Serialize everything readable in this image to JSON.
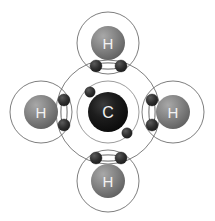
{
  "figure": {
    "background_color": "#ffffff",
    "width": 215,
    "height": 221
  },
  "molecule": {
    "formula": "CH4",
    "name": "Methane",
    "central_atom_symbol": "C",
    "outer_atom_symbol": "H",
    "outer_atom_count": 4,
    "bond_pair_count": 4,
    "electrons_per_bond_pair": 2,
    "carbon_inner_shell_electrons": 2,
    "carbon_outer_shell_electrons": 8
  },
  "colors": {
    "background": "#ffffff",
    "carbon_nucleus": "#141414",
    "carbon_nucleus_highlight": "#3a3a3a",
    "hydrogen_nucleus": "#7b7b7b",
    "hydrogen_nucleus_highlight": "#a6a6a6",
    "hydrogen_nucleus_shadow": "#5e5e5e",
    "electron": "#2e2e2e",
    "electron_highlight": "#565656",
    "shell_stroke": "#6f6f6f",
    "inner_shell_stroke": "#8a8a8a",
    "bond_lens_fill": "#ffffff",
    "bond_lens_stroke": "#555555",
    "atom_text": "#f2f2f2"
  },
  "atoms": [
    {
      "id": "carbon-center",
      "symbol": "C",
      "role": "central",
      "cx": 108,
      "cy": 112,
      "nucleus_r": 20,
      "inner_shell_r": 31,
      "outer_shell_r": 52
    },
    {
      "id": "hydrogen-top",
      "symbol": "H",
      "role": "outer",
      "position": "top",
      "cx": 108,
      "cy": 43,
      "nucleus_r": 17,
      "shell_r": 31
    },
    {
      "id": "hydrogen-bottom",
      "symbol": "H",
      "role": "outer",
      "position": "bottom",
      "cx": 108,
      "cy": 181,
      "nucleus_r": 17,
      "shell_r": 31
    },
    {
      "id": "hydrogen-left",
      "symbol": "H",
      "role": "outer",
      "position": "left",
      "cx": 41,
      "cy": 112,
      "nucleus_r": 17,
      "shell_r": 31
    },
    {
      "id": "hydrogen-right",
      "symbol": "H",
      "role": "outer",
      "position": "right",
      "cx": 173,
      "cy": 112,
      "nucleus_r": 17,
      "shell_r": 31
    }
  ],
  "carbon_inner_electrons": [
    {
      "id": "c-inner-e1",
      "cx": 90,
      "cy": 92,
      "r": 5.2
    },
    {
      "id": "c-inner-e2",
      "cx": 127,
      "cy": 133,
      "r": 5.2
    }
  ],
  "bond_pairs": [
    {
      "id": "bond-top",
      "orientation": "horizontal",
      "between": [
        "carbon-center",
        "hydrogen-top"
      ],
      "lens": {
        "cx": 108,
        "cy": 66,
        "rx": 14,
        "ry": 3.1
      },
      "electrons": [
        {
          "id": "bond-top-e1",
          "cx": 96,
          "cy": 66,
          "r": 6.0
        },
        {
          "id": "bond-top-e2",
          "cx": 121,
          "cy": 66,
          "r": 6.0
        }
      ]
    },
    {
      "id": "bond-bottom",
      "orientation": "horizontal",
      "between": [
        "carbon-center",
        "hydrogen-bottom"
      ],
      "lens": {
        "cx": 108,
        "cy": 158,
        "rx": 14,
        "ry": 3.1
      },
      "electrons": [
        {
          "id": "bond-bottom-e1",
          "cx": 96,
          "cy": 158,
          "r": 6.0
        },
        {
          "id": "bond-bottom-e2",
          "cx": 121,
          "cy": 158,
          "r": 6.0
        }
      ]
    },
    {
      "id": "bond-left",
      "orientation": "vertical",
      "between": [
        "carbon-center",
        "hydrogen-left"
      ],
      "lens": {
        "cx": 64,
        "cy": 112,
        "rx": 3.1,
        "ry": 14
      },
      "electrons": [
        {
          "id": "bond-left-e1",
          "cx": 64,
          "cy": 100,
          "r": 6.0
        },
        {
          "id": "bond-left-e2",
          "cx": 64,
          "cy": 125,
          "r": 6.0
        }
      ]
    },
    {
      "id": "bond-right",
      "orientation": "vertical",
      "between": [
        "carbon-center",
        "hydrogen-right"
      ],
      "lens": {
        "cx": 152,
        "cy": 112,
        "rx": 3.1,
        "ry": 14
      },
      "electrons": [
        {
          "id": "bond-right-e1",
          "cx": 152,
          "cy": 100,
          "r": 6.0
        },
        {
          "id": "bond-right-e2",
          "cx": 152,
          "cy": 125,
          "r": 6.0
        }
      ]
    }
  ]
}
